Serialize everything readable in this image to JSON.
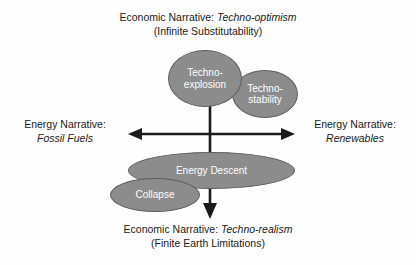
{
  "diagram": {
    "background_color": "#fefefe",
    "node_fill_color": "#8c8c8c",
    "node_border_color": "#5e5e5e",
    "node_text_color": "#ffffff",
    "axis_color": "#1a1a1a",
    "label_text_color": "#1a1a1a"
  },
  "labels": {
    "top": {
      "line1_prefix": "Economic Narrative: ",
      "line1_emphasis": "Techno-optimism",
      "line2": "(Infinite Substitutability)"
    },
    "bottom": {
      "line1_prefix": "Economic Narrative: ",
      "line1_emphasis": "Techno-realism",
      "line2": "(Finite Earth Limitations)"
    },
    "left": {
      "line1": "Energy Narrative:",
      "line2_emphasis": "Fossil Fuels"
    },
    "right": {
      "line1": "Energy Narrative:",
      "line2_emphasis": "Renewables"
    }
  },
  "nodes": [
    {
      "id": "techno-explosion",
      "label": "Techno-\nexplosion"
    },
    {
      "id": "techno-stability",
      "label": "Techno-\nstability"
    },
    {
      "id": "energy-descent",
      "label": "Energy Descent"
    },
    {
      "id": "collapse",
      "label": "Collapse"
    }
  ],
  "axes": {
    "horizontal": {
      "arrowheads": "both",
      "left_tip_x": 128,
      "right_tip_x": 295,
      "y": 134
    },
    "vertical": {
      "arrowheads": "down",
      "top_y": 80,
      "bottom_tip_y": 219,
      "x": 210
    }
  }
}
